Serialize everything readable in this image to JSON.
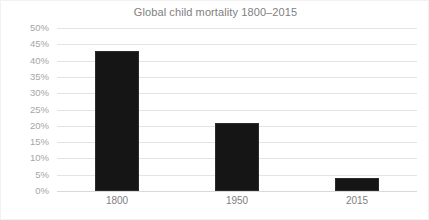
{
  "chart_data": {
    "type": "bar",
    "title": "Global child mortality 1800–2015",
    "xlabel": "",
    "ylabel": "",
    "categories": [
      "1800",
      "1950",
      "2015"
    ],
    "values": [
      43,
      21,
      4
    ],
    "value_format": "percent",
    "ylim": [
      0,
      50
    ],
    "ytick_values": [
      50,
      45,
      40,
      35,
      30,
      25,
      20,
      15,
      10,
      5,
      0
    ],
    "ytick_labels": [
      "50%",
      "45%",
      "40%",
      "35%",
      "30%",
      "25%",
      "20%",
      "15%",
      "10%",
      "5%",
      "0%"
    ],
    "grid": true,
    "grid_orientation": "horizontal",
    "legend": false,
    "legend_position": "none",
    "bar_color": "#151515",
    "grid_color": "#e4e4e4",
    "axis_label_color": "#a6a6a6",
    "title_color": "#808080",
    "background_color": "#ffffff",
    "series": [
      {
        "name": "Global child mortality",
        "values": [
          43,
          21,
          4
        ]
      }
    ]
  }
}
